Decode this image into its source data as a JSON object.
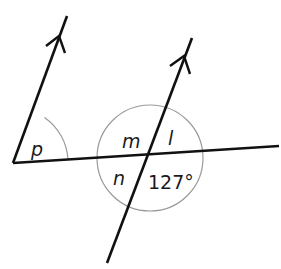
{
  "diagram": {
    "colors": {
      "line": "#111111",
      "arc": "#9a9a9a",
      "text": "#1a1a1a",
      "background": "#ffffff"
    },
    "labels": {
      "p": "p",
      "m": "m",
      "l": "l",
      "n": "n",
      "given_angle": "127°"
    }
  }
}
